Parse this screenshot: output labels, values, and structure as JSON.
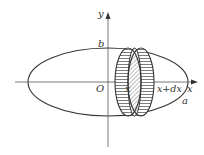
{
  "diagram": {
    "labels": {
      "y_axis": "y",
      "x_axis": "x",
      "origin": "O",
      "b": "b",
      "a": "a",
      "x": "x",
      "x_plus_dx": "x+dx"
    },
    "colors": {
      "stroke": "#333333",
      "background": "#ffffff"
    }
  }
}
